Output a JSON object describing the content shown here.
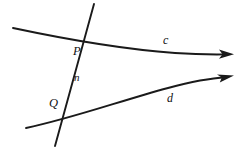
{
  "figure": {
    "type": "geometry-diagram",
    "background_color": "#ffffff",
    "stroke_color": "#1a1a1a",
    "width": 239,
    "height": 149,
    "labels": {
      "point_p": "P",
      "point_q": "Q",
      "line_n": "n",
      "curve_c": "c",
      "curve_d": "d"
    },
    "label_positions": {
      "point_p": {
        "x": 73,
        "y": 45
      },
      "point_q": {
        "x": 49,
        "y": 97
      },
      "line_n": {
        "x": 74,
        "y": 72
      },
      "curve_c": {
        "x": 163,
        "y": 34
      },
      "curve_d": {
        "x": 167,
        "y": 92
      }
    },
    "elements": {
      "curve_c": {
        "name": "curve-c",
        "description": "upper curve with arrowhead at right",
        "start": {
          "x": 13,
          "y": 28
        },
        "end": {
          "x": 224,
          "y": 54
        },
        "arrow_tip": {
          "x": 234,
          "y": 54
        }
      },
      "curve_d": {
        "name": "curve-d",
        "description": "lower curve with arrowhead at right",
        "start": {
          "x": 26,
          "y": 128
        },
        "end": {
          "x": 224,
          "y": 77
        },
        "arrow_tip": {
          "x": 234,
          "y": 77
        }
      },
      "line_n": {
        "name": "line-n",
        "description": "transversal straight line crossing both curves",
        "start": {
          "x": 94,
          "y": 4
        },
        "end": {
          "x": 55,
          "y": 146
        }
      }
    },
    "intersections": {
      "point_p": {
        "x": 85,
        "y": 43,
        "between": "line n and curve c"
      },
      "point_q": {
        "x": 63,
        "y": 114,
        "between": "line n and curve d"
      }
    }
  }
}
